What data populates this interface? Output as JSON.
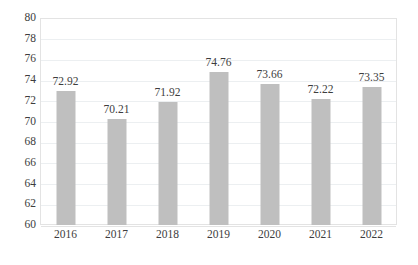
{
  "chart_data": {
    "type": "bar",
    "title": "",
    "subtitle": "",
    "xlabel": "",
    "ylabel": "",
    "categories": [
      "2016",
      "2017",
      "2018",
      "2019",
      "2020",
      "2021",
      "2022"
    ],
    "values": [
      72.92,
      70.21,
      71.92,
      74.76,
      73.66,
      72.22,
      73.35
    ],
    "data_labels": [
      "72.92",
      "70.21",
      "71.92",
      "74.76",
      "73.66",
      "72.22",
      "73.35"
    ],
    "series": [
      {
        "name": "",
        "values": [
          72.92,
          70.21,
          71.92,
          74.76,
          73.66,
          72.22,
          73.35
        ]
      }
    ],
    "ylim": [
      60,
      80
    ],
    "y_tick_step": 2,
    "y_tick_labels": [
      "80",
      "78",
      "76",
      "74",
      "72",
      "70",
      "68",
      "66",
      "64",
      "62",
      "60"
    ],
    "y_tick_values": [
      80,
      78,
      76,
      74,
      72,
      70,
      68,
      66,
      64,
      62,
      60
    ],
    "grid": true,
    "grid_axis": "y",
    "legend": false,
    "legend_position": "none",
    "bar_color": "#bfbfbf",
    "grid_color": "#eceff1",
    "plot_border_color": "#e3e3e3",
    "text_color": "#3d3d3d",
    "background_color": "#ffffff"
  }
}
